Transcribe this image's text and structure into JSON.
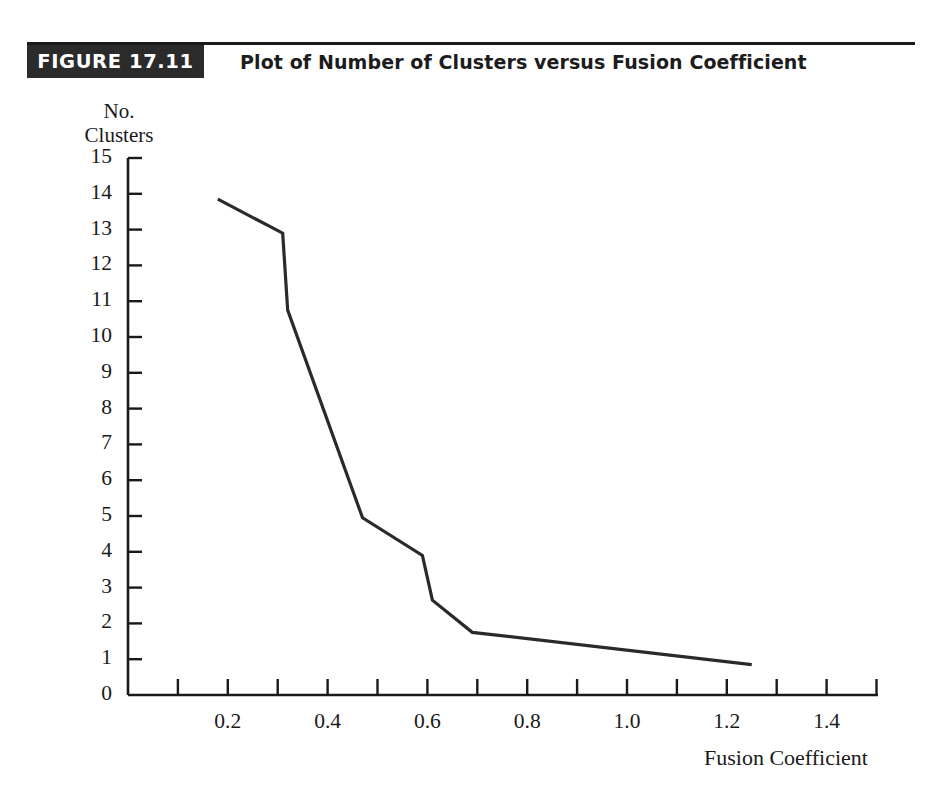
{
  "figure": {
    "badge_label": "FIGURE 17.11",
    "title": "Plot of Number of Clusters versus Fusion Coefficient",
    "badge_bg": "#2b2b2b",
    "badge_fg": "#ffffff",
    "rule_color": "#1a1a1a"
  },
  "chart_data": {
    "type": "line",
    "title": "Plot of Number of Clusters versus Fusion Coefficient",
    "xlabel": "Fusion Coefficient",
    "ylabel": "No.\nClusters",
    "ylabel_lines": [
      "No.",
      "Clusters"
    ],
    "xlim": [
      0.0,
      1.5
    ],
    "ylim": [
      0,
      15
    ],
    "grid": false,
    "legend": null,
    "line_color": "#2a2a2a",
    "line_width": 3.2,
    "x_ticks_major": [
      0.2,
      0.4,
      0.6,
      0.8,
      1.0,
      1.2,
      1.4
    ],
    "x_tick_labels": [
      "0.2",
      "0.4",
      "0.6",
      "0.8",
      "1.0",
      "1.2",
      "1.4"
    ],
    "x_ticks_minor": [
      0.1,
      0.3,
      0.5,
      0.7,
      0.9,
      1.1,
      1.3,
      1.5
    ],
    "y_ticks": [
      0,
      1,
      2,
      3,
      4,
      5,
      6,
      7,
      8,
      9,
      10,
      11,
      12,
      13,
      14,
      15
    ],
    "y_tick_labels": [
      "0",
      "1",
      "2",
      "3",
      "4",
      "5",
      "6",
      "7",
      "8",
      "9",
      "10",
      "11",
      "12",
      "13",
      "14",
      "15"
    ],
    "x": [
      0.18,
      0.31,
      0.32,
      0.47,
      0.59,
      0.61,
      0.69,
      1.25
    ],
    "y": [
      13.85,
      12.9,
      10.75,
      4.95,
      3.9,
      2.65,
      1.75,
      0.85
    ],
    "points": [
      {
        "x": 0.18,
        "y": 13.85
      },
      {
        "x": 0.31,
        "y": 12.9
      },
      {
        "x": 0.32,
        "y": 10.75
      },
      {
        "x": 0.47,
        "y": 4.95
      },
      {
        "x": 0.59,
        "y": 3.9
      },
      {
        "x": 0.61,
        "y": 2.65
      },
      {
        "x": 0.69,
        "y": 1.75
      },
      {
        "x": 1.25,
        "y": 0.85
      }
    ]
  }
}
